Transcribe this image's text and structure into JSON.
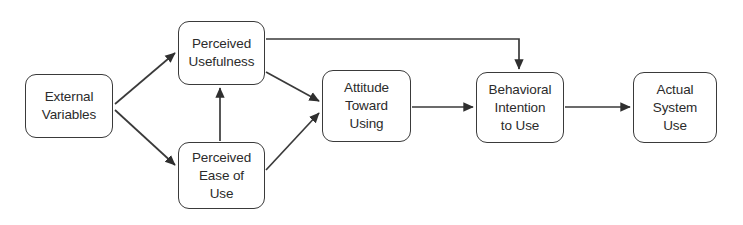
{
  "diagram": {
    "type": "flow-diagram",
    "canvas": {
      "width": 743,
      "height": 225,
      "background": "#ffffff"
    },
    "style": {
      "node_fill": "#ffffff",
      "node_border": "#3a3a3a",
      "text_color": "#2b2b2b",
      "edge_color": "#3a3a3a",
      "corner_radius": 11
    },
    "nodes": [
      {
        "id": "external-variables",
        "label": "External\nVariables",
        "x": 25,
        "y": 74,
        "w": 88,
        "h": 64
      },
      {
        "id": "perceived-usefulness",
        "label": "Perceived\nUsefulness",
        "x": 178,
        "y": 21,
        "w": 87,
        "h": 64
      },
      {
        "id": "perceived-ease-of-use",
        "label": "Perceived\nEase of\nUse",
        "x": 178,
        "y": 142,
        "w": 87,
        "h": 67
      },
      {
        "id": "attitude-toward-using",
        "label": "Attitude\nToward\nUsing",
        "x": 322,
        "y": 70,
        "w": 89,
        "h": 72
      },
      {
        "id": "behavioral-intention-to-use",
        "label": "Behavioral\nIntention\nto Use",
        "x": 476,
        "y": 72,
        "w": 88,
        "h": 71
      },
      {
        "id": "actual-system-use",
        "label": "Actual\nSystem\nUse",
        "x": 633,
        "y": 72,
        "w": 84,
        "h": 71
      }
    ],
    "edges": [
      {
        "id": "ev-to-pu",
        "from": "external-variables",
        "to": "perceived-usefulness",
        "kind": "straight"
      },
      {
        "id": "ev-to-peu",
        "from": "external-variables",
        "to": "perceived-ease-of-use",
        "kind": "straight"
      },
      {
        "id": "peu-to-pu",
        "from": "perceived-ease-of-use",
        "to": "perceived-usefulness",
        "kind": "straight"
      },
      {
        "id": "pu-to-atu",
        "from": "perceived-usefulness",
        "to": "attitude-toward-using",
        "kind": "straight"
      },
      {
        "id": "peu-to-atu",
        "from": "perceived-ease-of-use",
        "to": "attitude-toward-using",
        "kind": "straight"
      },
      {
        "id": "pu-to-biu",
        "from": "perceived-usefulness",
        "to": "behavioral-intention-to-use",
        "kind": "elbow"
      },
      {
        "id": "atu-to-biu",
        "from": "attitude-toward-using",
        "to": "behavioral-intention-to-use",
        "kind": "straight"
      },
      {
        "id": "biu-to-asu",
        "from": "behavioral-intention-to-use",
        "to": "actual-system-use",
        "kind": "straight"
      }
    ]
  }
}
